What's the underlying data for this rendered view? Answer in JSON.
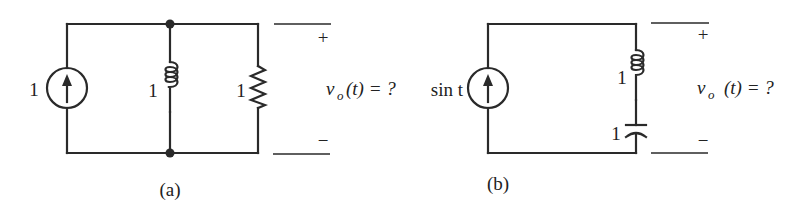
{
  "figure": {
    "background": "#ffffff",
    "ink_color": "#2a2a2a"
  },
  "circuit_a": {
    "caption": "(a)",
    "source": {
      "type": "current-source",
      "value": "1",
      "direction": "up"
    },
    "inductor": {
      "value": "1"
    },
    "resistor": {
      "value": "1"
    },
    "output": {
      "plus": "+",
      "minus": "−",
      "var": "v",
      "sub": "o",
      "rest": "(t) = ?"
    }
  },
  "circuit_b": {
    "caption": "(b)",
    "source": {
      "type": "current-source",
      "value": "sin t",
      "direction": "up"
    },
    "inductor": {
      "value": "1"
    },
    "capacitor": {
      "value": "1"
    },
    "output": {
      "plus": "+",
      "minus": "−",
      "var": "v",
      "sub": "o",
      "rest": "(t) = ?"
    }
  }
}
